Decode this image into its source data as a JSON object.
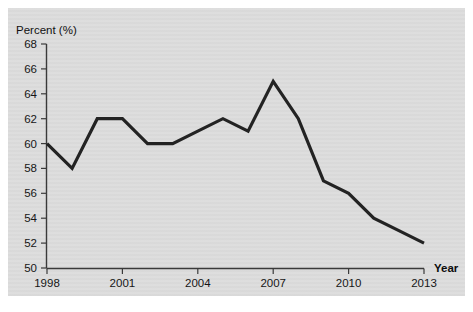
{
  "chart_data": {
    "type": "line",
    "title": "",
    "subtitle": "",
    "xlabel": "Year",
    "ylabel": "Percent (%)",
    "ylabel_position": "top-left",
    "xlabel_position": "right-of-axis",
    "grid": false,
    "legend": null,
    "background_color": "#dcdcdc",
    "line_color": "#232323",
    "x": [
      1998,
      1999,
      2000,
      2001,
      2002,
      2003,
      2004,
      2005,
      2006,
      2007,
      2008,
      2009,
      2010,
      2011,
      2012,
      2013
    ],
    "values": [
      60,
      58,
      62,
      62,
      60,
      60,
      61,
      62,
      61,
      65,
      62,
      57,
      56,
      54,
      53,
      52
    ],
    "series": [
      {
        "name": "Percent",
        "values": [
          60,
          58,
          62,
          62,
          60,
          60,
          61,
          62,
          61,
          65,
          62,
          57,
          56,
          54,
          53,
          52
        ]
      }
    ],
    "xlim": [
      1998,
      2013
    ],
    "ylim": [
      50,
      68
    ],
    "ytick_labels": [
      "50",
      "52",
      "54",
      "56",
      "58",
      "60",
      "62",
      "64",
      "66",
      "68"
    ],
    "ytick_values": [
      50,
      52,
      54,
      56,
      58,
      60,
      62,
      64,
      66,
      68
    ],
    "xtick_labels": [
      "1998",
      "2001",
      "2004",
      "2007",
      "2010",
      "2013"
    ],
    "xtick_values": [
      1998,
      2001,
      2004,
      2007,
      2010,
      2013
    ]
  }
}
